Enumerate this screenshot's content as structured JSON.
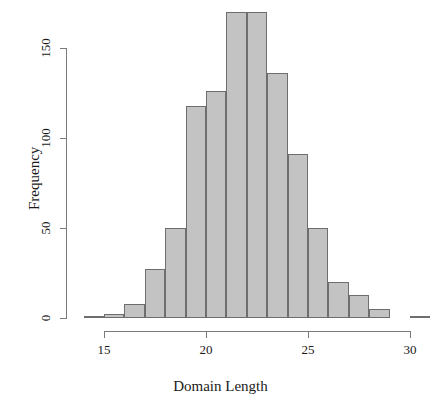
{
  "chart_data": {
    "type": "bar",
    "title": "",
    "subtitle": "",
    "xlabel": "Domain Length",
    "ylabel": "Frequency",
    "grid": false,
    "legend": false,
    "legend_position": "none",
    "bin_width": 1,
    "xlim": [
      14,
      31
    ],
    "ylim": [
      0,
      170
    ],
    "x_ticks": [
      15,
      20,
      25,
      30
    ],
    "x_tick_labels": [
      "15",
      "20",
      "25",
      "30"
    ],
    "y_ticks": [
      0,
      50,
      100,
      150
    ],
    "y_tick_labels": [
      "0",
      "50",
      "100",
      "150"
    ],
    "bin_edges": [
      14,
      15,
      16,
      17,
      18,
      19,
      20,
      21,
      22,
      23,
      24,
      25,
      26,
      27,
      28,
      29,
      30,
      31
    ],
    "categories": [
      "14-15",
      "15-16",
      "16-17",
      "17-18",
      "18-19",
      "19-20",
      "20-21",
      "21-22",
      "22-23",
      "23-24",
      "24-25",
      "25-26",
      "26-27",
      "27-28",
      "28-29",
      "29-30",
      "30-31"
    ],
    "values": [
      1,
      2,
      8,
      27,
      50,
      118,
      126,
      170,
      170,
      136,
      91,
      50,
      20,
      13,
      5,
      0,
      1
    ],
    "bar_fill_color": "#c3c3c3",
    "bar_border_color": "#6e6e6e",
    "axis_color": "#7a7a7a",
    "text_color": "#1a1a1a",
    "background_color": "#ffffff"
  }
}
